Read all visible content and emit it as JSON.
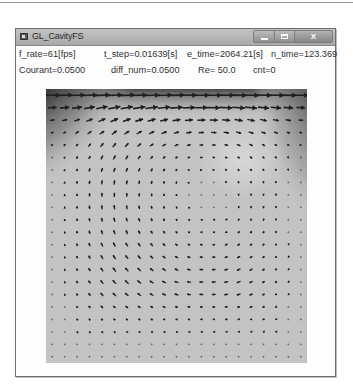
{
  "window": {
    "title": "GL_CavityFS",
    "controls": {
      "minimize_icon": "minimize-icon",
      "maximize_icon": "maximize-icon",
      "close_label": "X"
    }
  },
  "stats": {
    "row1": {
      "f_rate": "f_rate=61[fps]",
      "t_step": "t_step=0.01639[s]",
      "e_time": "e_time=2064.21[s]",
      "n_time": "n_time=123.369"
    },
    "row2": {
      "courant": "Courant=0.0500",
      "diff_num": "diff_num=0.0500",
      "re": "Re= 50.0",
      "cnt": "cnt=0"
    }
  },
  "simulation": {
    "type": "lid-driven cavity flow, velocity vector field",
    "grid_cols": 21,
    "grid_rows": 22,
    "lid_direction": "right",
    "circulation": "clockwise",
    "colors": {
      "field_bg": "#c3c3c3",
      "shadow_dark": "#2a2a2a",
      "arrow": "#1e1e1e"
    }
  }
}
